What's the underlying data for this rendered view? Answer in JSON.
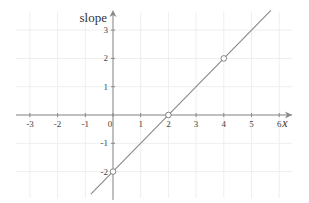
{
  "chart_data": {
    "type": "line",
    "title": "",
    "xlabel": "x",
    "ylabel": "slope",
    "xlim": [
      -3.4,
      6.3
    ],
    "ylim": [
      -2.9,
      3.5
    ],
    "grid": true,
    "x_ticks": [
      -3,
      -2,
      -1,
      0,
      1,
      2,
      3,
      4,
      5,
      6
    ],
    "y_ticks": [
      -2,
      -1,
      1,
      2,
      3
    ],
    "series": [
      {
        "name": "line",
        "equation": "y = x - 2",
        "x": [
          -0.8,
          5.7
        ],
        "y": [
          -2.8,
          3.7
        ],
        "color": "#888888"
      }
    ],
    "points": [
      {
        "x": 0,
        "y": -2,
        "marker": "open-circle"
      },
      {
        "x": 2,
        "y": 0,
        "marker": "open-circle"
      },
      {
        "x": 4,
        "y": 2,
        "marker": "open-circle"
      }
    ],
    "colors": {
      "axis": "#888888",
      "grid": "#eeeeee",
      "line": "#888888",
      "text": "#444444"
    }
  }
}
